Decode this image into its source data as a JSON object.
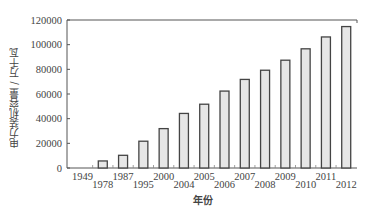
{
  "chart_data": {
    "type": "bar",
    "title": "",
    "xlabel": "年份",
    "ylabel": "电力装机容量 / 万千瓦",
    "categories": [
      "1949",
      "1978",
      "1987",
      "1995",
      "2000",
      "2004",
      "2005",
      "2006",
      "2007",
      "2008",
      "2009",
      "2010",
      "2011",
      "2012"
    ],
    "values": [
      185,
      5712,
      10290,
      21722,
      31932,
      44239,
      51718,
      62370,
      71822,
      79273,
      87410,
      96641,
      106253,
      114676
    ],
    "ylim": [
      0,
      120000
    ],
    "yticks": [
      0,
      20000,
      40000,
      60000,
      80000,
      100000,
      120000
    ],
    "ytick_labels": [
      "0",
      "20000",
      "40000",
      "60000",
      "80000",
      "100000",
      "120000"
    ],
    "grid": false,
    "legend": null,
    "colors": {
      "bar_fill": "#e6e6e6",
      "bar_stroke": "#444444",
      "axis": "#555555"
    }
  }
}
